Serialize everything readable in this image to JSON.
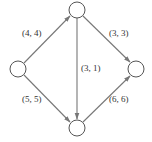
{
  "diagram": {
    "type": "directed-flow-network",
    "colors": {
      "node_stroke": "#555555",
      "edge": "#777777",
      "label": "#333333",
      "background": "#ffffff"
    },
    "nodes": [
      {
        "id": "left",
        "cx": 18,
        "cy": 69,
        "r": 8
      },
      {
        "id": "top",
        "cx": 77,
        "cy": 10,
        "r": 8
      },
      {
        "id": "bottom",
        "cx": 77,
        "cy": 128,
        "r": 8
      },
      {
        "id": "right",
        "cx": 136,
        "cy": 69,
        "r": 8
      }
    ],
    "edges": [
      {
        "from": "left",
        "to": "top",
        "label": "(4, 4)",
        "lx": 22,
        "ly": 36
      },
      {
        "from": "top",
        "to": "right",
        "label": "(3, 3)",
        "lx": 109,
        "ly": 36
      },
      {
        "from": "top",
        "to": "bottom",
        "label": "(3, 1)",
        "lx": 80,
        "ly": 71
      },
      {
        "from": "left",
        "to": "bottom",
        "label": "(5, 5)",
        "lx": 22,
        "ly": 102
      },
      {
        "from": "bottom",
        "to": "right",
        "label": "(6, 6)",
        "lx": 109,
        "ly": 102
      }
    ]
  }
}
